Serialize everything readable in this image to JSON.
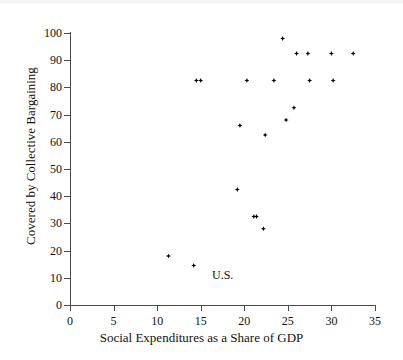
{
  "chart_data": {
    "type": "scatter",
    "title": "",
    "xlabel": "Social Expenditures as a Share of GDP",
    "ylabel": "Covered by Collective Bargaining",
    "xlim": [
      0,
      35
    ],
    "ylim": [
      0,
      100
    ],
    "xticks": [
      0,
      5,
      10,
      15,
      20,
      25,
      30,
      35
    ],
    "yticks": [
      0,
      10,
      20,
      30,
      40,
      50,
      60,
      70,
      80,
      90,
      100
    ],
    "grid": false,
    "legend": "none",
    "marker_color": "#000000",
    "axis_color": "#4a4a4a",
    "points": [
      {
        "x": 11.3,
        "y": 18.0
      },
      {
        "x": 14.2,
        "y": 14.5
      },
      {
        "x": 14.5,
        "y": 82.5
      },
      {
        "x": 15.0,
        "y": 82.5
      },
      {
        "x": 19.2,
        "y": 42.5
      },
      {
        "x": 19.5,
        "y": 66.0
      },
      {
        "x": 20.3,
        "y": 82.5
      },
      {
        "x": 21.1,
        "y": 32.5
      },
      {
        "x": 21.4,
        "y": 32.5
      },
      {
        "x": 22.2,
        "y": 28.0
      },
      {
        "x": 22.4,
        "y": 62.5
      },
      {
        "x": 23.4,
        "y": 82.5
      },
      {
        "x": 24.4,
        "y": 98.0
      },
      {
        "x": 24.8,
        "y": 68.0
      },
      {
        "x": 25.7,
        "y": 72.5
      },
      {
        "x": 26.0,
        "y": 92.5
      },
      {
        "x": 27.3,
        "y": 92.5
      },
      {
        "x": 27.5,
        "y": 82.5
      },
      {
        "x": 30.0,
        "y": 92.5
      },
      {
        "x": 30.2,
        "y": 82.5
      },
      {
        "x": 32.5,
        "y": 92.5
      }
    ],
    "annotations": [
      {
        "text": "U.S.",
        "x": 16.3,
        "y": 11.0
      }
    ]
  }
}
